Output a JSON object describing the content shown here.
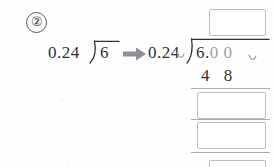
{
  "worksheet": {
    "problem_number": "②",
    "original_expression": {
      "divisor": "0.24",
      "dividend": "6",
      "operator_icon": "division-bracket"
    },
    "transform_arrow": "right-arrow-icon",
    "converted_expression": {
      "divisor": "0.24",
      "divisor_caret": "decimal-shift-caret",
      "dividend_whole": "6.",
      "dividend_appended_zeros": "0 0",
      "dividend_caret": "decimal-shift-caret",
      "operator_icon": "division-bracket"
    },
    "work_rows": [
      {
        "label": "partial-product",
        "value": "4 8"
      }
    ],
    "answer_boxes": [
      {
        "name": "quotient",
        "value": ""
      },
      {
        "name": "subtraction-step-1",
        "value": ""
      },
      {
        "name": "subtraction-step-2",
        "value": ""
      },
      {
        "name": "subtraction-step-3",
        "value": ""
      }
    ],
    "colors": {
      "ink": "#2e3236",
      "appended_digit": "#9ba0a4",
      "box_border": "#b9bdc1",
      "rule": "#a9adb1",
      "paper": "#fefefe"
    }
  }
}
